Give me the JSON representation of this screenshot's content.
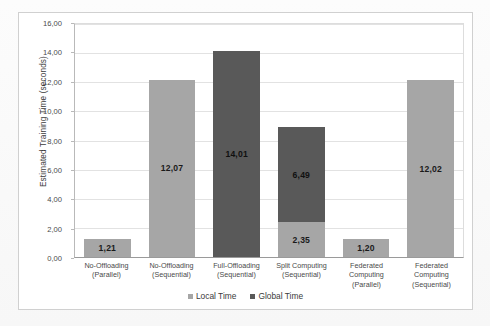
{
  "chart_data": {
    "type": "bar",
    "stacked": true,
    "title": "",
    "xlabel": "",
    "ylabel": "Estimated Training Time (seconds)",
    "ylim": [
      0,
      16
    ],
    "ytick_step": 2,
    "ytick_labels": [
      "16,00",
      "14,00",
      "12,00",
      "10,00",
      "8,00",
      "6,00",
      "4,00",
      "2,00",
      "0,00"
    ],
    "ytick_values": [
      16,
      14,
      12,
      10,
      8,
      6,
      4,
      2,
      0
    ],
    "grid": true,
    "legend_position": "bottom",
    "decimal_separator": ",",
    "categories": [
      [
        "No-Offloading",
        "(Parallel)"
      ],
      [
        "No-Offloading",
        "(Sequential)"
      ],
      [
        "Full-Offloading",
        "(Sequential)"
      ],
      [
        "Split Computing",
        "(Sequential)"
      ],
      [
        "Federated",
        "Computing",
        "(Parallel)"
      ],
      [
        "Federated",
        "Computing",
        "(Sequential)"
      ]
    ],
    "series": [
      {
        "name": "Local Time",
        "color": "#a6a6a6",
        "values": [
          1.21,
          12.07,
          null,
          2.35,
          1.2,
          12.02
        ],
        "labels": [
          "1,21",
          "12,07",
          "",
          "2,35",
          "1,20",
          "12,02"
        ]
      },
      {
        "name": "Global Time",
        "color": "#595959",
        "values": [
          null,
          null,
          14.01,
          6.49,
          null,
          null
        ],
        "labels": [
          "",
          "",
          "14,01",
          "6,49",
          "",
          ""
        ]
      }
    ],
    "bars": [
      {
        "category": "No-Offloading (Parallel)",
        "segments": [
          {
            "series": "Local Time",
            "value": 1.21,
            "label": "1,21"
          }
        ]
      },
      {
        "category": "No-Offloading (Sequential)",
        "segments": [
          {
            "series": "Local Time",
            "value": 12.07,
            "label": "12,07"
          }
        ]
      },
      {
        "category": "Full-Offloading (Sequential)",
        "segments": [
          {
            "series": "Global Time",
            "value": 14.01,
            "label": "14,01"
          }
        ]
      },
      {
        "category": "Split Computing (Sequential)",
        "segments": [
          {
            "series": "Local Time",
            "value": 2.35,
            "label": "2,35"
          },
          {
            "series": "Global Time",
            "value": 6.49,
            "label": "6,49"
          }
        ]
      },
      {
        "category": "Federated Computing (Parallel)",
        "segments": [
          {
            "series": "Local Time",
            "value": 1.2,
            "label": "1,20"
          }
        ]
      },
      {
        "category": "Federated Computing (Sequential)",
        "segments": [
          {
            "series": "Local Time",
            "value": 12.02,
            "label": "12,02"
          }
        ]
      }
    ]
  },
  "legend": {
    "items": [
      {
        "label": "Local Time",
        "color": "#a6a6a6"
      },
      {
        "label": "Global Time",
        "color": "#595959"
      }
    ]
  },
  "colors": {
    "local_time": "#a6a6a6",
    "global_time": "#595959",
    "gridline": "#e2e2e2",
    "axis": "#9a9a9a",
    "plot_background": "#ffffff",
    "page_background": "#fbfbfb"
  }
}
